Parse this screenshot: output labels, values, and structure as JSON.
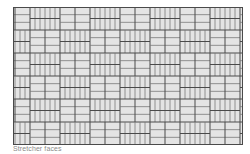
{
  "figure": {
    "pattern": "basketweave",
    "brick_fill": "#e4e4e4",
    "joint_color": "#4a4a4a",
    "minor_line_color": "#7a7a7a",
    "cell_width": 30,
    "cell_height": 23,
    "columns": 8,
    "rows": 6
  },
  "caption": "Stretcher faces"
}
